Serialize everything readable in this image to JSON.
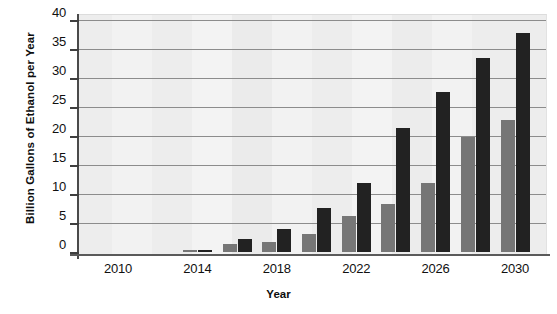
{
  "chart_data": {
    "type": "bar",
    "title": "",
    "xlabel": "Year",
    "ylabel": "Billion Gallons of Ethanol per Year",
    "ylim": [
      0,
      40
    ],
    "ytick_values": [
      0,
      5,
      10,
      15,
      20,
      25,
      30,
      35,
      40
    ],
    "ytick_labels": [
      "0",
      "5",
      "10",
      "15",
      "20",
      "25",
      "30",
      "35",
      "40"
    ],
    "grid": true,
    "grid_axis": "y",
    "legend": "none",
    "x": [
      2010,
      2012,
      2014,
      2016,
      2018,
      2020,
      2022,
      2024,
      2026,
      2028,
      2030
    ],
    "xtick_labels": [
      "2010",
      "2014",
      "2018",
      "2022",
      "2026",
      "2030"
    ],
    "xtick_values": [
      2010,
      2014,
      2018,
      2022,
      2026,
      2030
    ],
    "series": [
      {
        "name": "lower-estimate",
        "color": "#767676",
        "values": [
          0,
          0,
          0.3,
          1.3,
          1.8,
          3.1,
          6.2,
          8.3,
          11.9,
          19.8,
          22.7
        ]
      },
      {
        "name": "upper-estimate",
        "color": "#222222",
        "values": [
          0,
          0,
          0.4,
          2.2,
          4.0,
          7.6,
          11.9,
          21.3,
          27.6,
          33.4,
          37.8
        ]
      }
    ]
  },
  "figure": {
    "background_color": "#ffffff",
    "plot_background_color": "#f0f0f0",
    "gridline_color": "#8c8c8c",
    "axis_color": "#4a4a4a"
  }
}
